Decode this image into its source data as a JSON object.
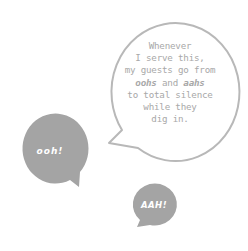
{
  "bubbles": {
    "quote": {
      "lines": [
        "Whenever",
        "I serve this,",
        "my guests go from"
      ],
      "line4_a": "oohs",
      "line4_b": " and ",
      "line4_c": "aahs",
      "lines_after": [
        "to total silence",
        "while they",
        "dig in."
      ],
      "outline_color": "#b5b5b5"
    },
    "ooh": {
      "label": "ooh!",
      "fill": "#a3a3a3"
    },
    "aah": {
      "label": "AAH!",
      "fill": "#a3a3a3"
    }
  }
}
